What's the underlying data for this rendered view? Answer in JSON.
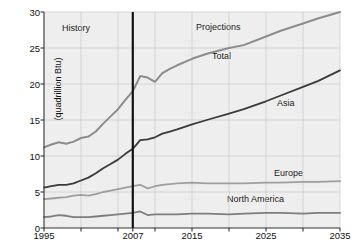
{
  "chart_data": {
    "type": "line",
    "title": "",
    "subtitle": "",
    "xlabel": "",
    "ylabel": "(quadrillion Btu)",
    "xlim": [
      1995,
      2035
    ],
    "ylim": [
      0,
      30
    ],
    "grid": true,
    "legend_position": "inline-annotations",
    "x_ticks": [
      1995,
      2007,
      2015,
      2025,
      2035
    ],
    "x_tick_labels": [
      "1995",
      "2007",
      "2015",
      "2025",
      "2035"
    ],
    "x_minor_ticks": [
      2000,
      2005,
      2010,
      2020,
      2030
    ],
    "y_ticks": [
      0,
      5,
      10,
      15,
      20,
      25,
      30
    ],
    "y_tick_labels": [
      "0",
      "5",
      "10",
      "15",
      "20",
      "25",
      "30"
    ],
    "divider_x": 2007,
    "annotations": [
      {
        "text": "History",
        "x": 1999.5,
        "y": 27.2
      },
      {
        "text": "Projections",
        "x": 2021.5,
        "y": 27.4
      },
      {
        "text": "Total",
        "x": 2019.0,
        "y": 23.4
      },
      {
        "text": "Asia",
        "x": 2028.0,
        "y": 15.4
      },
      {
        "text": "Europe",
        "x": 2027.5,
        "y": 7.9
      },
      {
        "text": "North America",
        "x": 2023.5,
        "y": 4.3
      }
    ],
    "x": [
      1995,
      1996,
      1997,
      1998,
      1999,
      2000,
      2001,
      2002,
      2003,
      2004,
      2005,
      2006,
      2007,
      2008,
      2009,
      2010,
      2011,
      2012,
      2013,
      2015,
      2017,
      2020,
      2022,
      2025,
      2027,
      2030,
      2032,
      2035
    ],
    "series": [
      {
        "name": "Total",
        "color": "#8c8c8c",
        "width": 2.0,
        "values": [
          11.2,
          11.6,
          11.9,
          11.7,
          12.0,
          12.5,
          12.7,
          13.4,
          14.5,
          15.5,
          16.5,
          17.8,
          19.0,
          21.1,
          20.9,
          20.3,
          21.5,
          22.1,
          22.6,
          23.5,
          24.2,
          25.0,
          25.4,
          26.6,
          27.4,
          28.4,
          29.1,
          30.0
        ]
      },
      {
        "name": "Asia",
        "color": "#3a3a3a",
        "width": 1.8,
        "values": [
          5.6,
          5.8,
          6.0,
          6.0,
          6.2,
          6.6,
          7.0,
          7.6,
          8.3,
          8.9,
          9.5,
          10.3,
          11.0,
          12.2,
          12.3,
          12.6,
          13.1,
          13.4,
          13.7,
          14.4,
          15.0,
          15.9,
          16.5,
          17.6,
          18.4,
          19.6,
          20.4,
          21.9
        ]
      },
      {
        "name": "Europe",
        "color": "#9e9e9e",
        "width": 1.8,
        "values": [
          4.0,
          4.1,
          4.2,
          4.3,
          4.5,
          4.6,
          4.5,
          4.7,
          5.0,
          5.2,
          5.4,
          5.6,
          5.8,
          6.0,
          5.5,
          5.8,
          6.0,
          6.1,
          6.2,
          6.3,
          6.2,
          6.2,
          6.2,
          6.3,
          6.3,
          6.4,
          6.4,
          6.5
        ]
      },
      {
        "name": "North America",
        "color": "#7d7d7d",
        "width": 1.8,
        "values": [
          1.5,
          1.6,
          1.8,
          1.7,
          1.5,
          1.5,
          1.5,
          1.6,
          1.7,
          1.8,
          1.9,
          2.0,
          2.1,
          2.3,
          1.8,
          1.9,
          1.9,
          1.9,
          1.9,
          2.0,
          2.0,
          1.9,
          2.0,
          2.1,
          2.1,
          2.0,
          2.1,
          2.1
        ]
      }
    ]
  }
}
